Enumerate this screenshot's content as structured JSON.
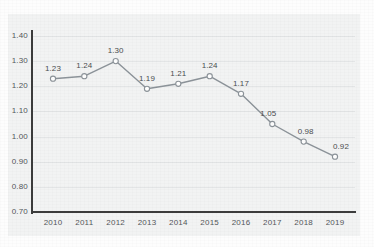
{
  "chart_data": {
    "type": "line",
    "title": "",
    "subtitle": "",
    "xlabel": "",
    "ylabel": "",
    "categories": [
      "2010",
      "2011",
      "2012",
      "2013",
      "2014",
      "2015",
      "2016",
      "2017",
      "2018",
      "2019"
    ],
    "values": [
      1.23,
      1.24,
      1.3,
      1.19,
      1.21,
      1.24,
      1.17,
      1.05,
      0.98,
      0.92
    ],
    "point_labels": [
      "1.23",
      "1.24",
      "1.30",
      "1.19",
      "1.21",
      "1.24",
      "1.17",
      "1.05",
      "0.98",
      "0.92"
    ],
    "ylim": [
      0.7,
      1.4
    ],
    "ytick_step": 0.1,
    "ytick_labels": [
      "1.40",
      "1.30",
      "1.20",
      "1.10",
      "1.00",
      "0.90",
      "0.80",
      "0.70"
    ],
    "ytick_values": [
      1.4,
      1.3,
      1.2,
      1.1,
      1.0,
      0.9,
      0.8,
      0.7
    ],
    "grid": true,
    "grid_axis": "y",
    "legend": false,
    "legend_position": "none",
    "marker": "open-circle",
    "data_labels_shown": true,
    "series": [
      {
        "name": "",
        "values": [
          1.23,
          1.24,
          1.3,
          1.19,
          1.21,
          1.24,
          1.17,
          1.05,
          0.98,
          0.92
        ]
      }
    ],
    "colors": {
      "line": "#8c9399",
      "marker_stroke": "#8c9399",
      "marker_fill": "#ffffff",
      "gridline": "#e3e5e6",
      "axis": "#3c3c3c",
      "tick_text": "#53565a",
      "label_text": "#4a4d50",
      "plot_background": "#f2f3f3",
      "page_background": "#fdfdfd"
    }
  }
}
